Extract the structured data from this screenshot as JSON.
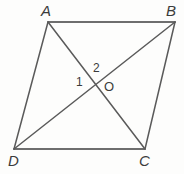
{
  "figure": {
    "shape_type": "parallelogram",
    "background_color": "#fdfdfc",
    "stroke_color": "#5a5a5a",
    "label_color": "#3b3b3b",
    "vertices": [
      {
        "name": "A",
        "label": "A",
        "x": 48,
        "y": 22
      },
      {
        "name": "B",
        "label": "B",
        "x": 175,
        "y": 22
      },
      {
        "name": "C",
        "label": "C",
        "x": 145,
        "y": 149
      },
      {
        "name": "D",
        "label": "D",
        "x": 14,
        "y": 149
      }
    ],
    "sides": [
      {
        "name": "AB",
        "from": "A",
        "to": "B"
      },
      {
        "name": "BC",
        "from": "B",
        "to": "C"
      },
      {
        "name": "CD",
        "from": "C",
        "to": "D"
      },
      {
        "name": "DA",
        "from": "D",
        "to": "A"
      }
    ],
    "diagonals": [
      {
        "name": "AC",
        "from": "A",
        "to": "C"
      },
      {
        "name": "BD",
        "from": "B",
        "to": "D"
      }
    ],
    "intersection": {
      "name": "O",
      "label": "O",
      "x": 96,
      "y": 86
    },
    "angle_marks": [
      {
        "name": "angle-1",
        "label": "1",
        "x": 81,
        "y": 83
      },
      {
        "name": "angle-2",
        "label": "2",
        "x": 98,
        "y": 69
      }
    ]
  }
}
